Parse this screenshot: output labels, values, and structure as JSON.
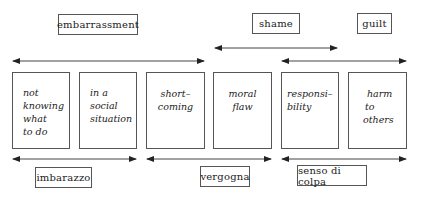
{
  "top_labels": {
    "embarrassment": "embarrassment",
    "shame": "shame",
    "guilt": "guilt"
  },
  "bottom_labels": {
    "imbarazzo": "imbarazzo",
    "vergogna": "vergogna",
    "senso_di_colpa": "senso di colpa"
  },
  "boxes": [
    {
      "lines": [
        "not",
        "knowing",
        "what",
        "to do"
      ]
    },
    {
      "lines": [
        "in a",
        "social",
        "situation"
      ]
    },
    {
      "lines": [
        "short–",
        "coming"
      ]
    },
    {
      "lines": [
        "moral",
        "flaw"
      ]
    },
    {
      "lines": [
        "responsi–",
        "bility"
      ]
    },
    {
      "lines": [
        "harm",
        "to",
        "others"
      ]
    }
  ]
}
